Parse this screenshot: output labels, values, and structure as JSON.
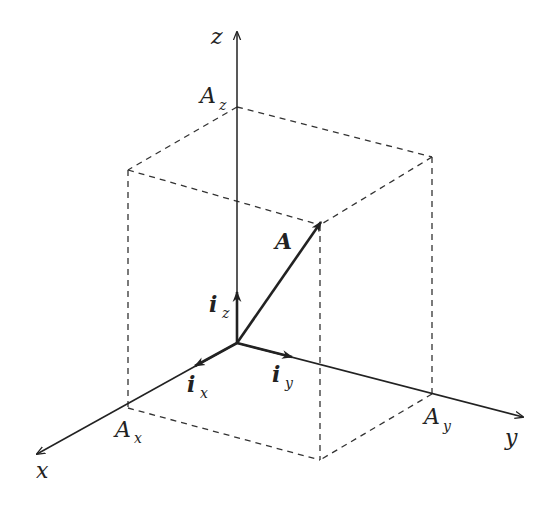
{
  "diagram": {
    "colors": {
      "line": "#222222",
      "dashed": "#333333",
      "background": "#ffffff"
    },
    "points": {
      "origin": [
        237,
        343
      ],
      "z_end": [
        237,
        30
      ],
      "x_end": [
        35,
        455
      ],
      "y_end": [
        525,
        417
      ],
      "Az": [
        237,
        107
      ],
      "Ax": [
        128,
        408
      ],
      "Ay": [
        432,
        394
      ],
      "A_tip": [
        320,
        222
      ],
      "top_left": [
        128,
        170
      ],
      "top_right": [
        432,
        157
      ],
      "top_front": [
        320,
        225
      ],
      "bottom_front": [
        320,
        460
      ]
    },
    "labels": {
      "z_axis": "z",
      "x_axis": "x",
      "y_axis": "y",
      "Az": "A",
      "Az_sub": "z",
      "Ax": "A",
      "Ax_sub": "x",
      "Ay": "A",
      "Ay_sub": "y",
      "vector": "A",
      "ix": "i",
      "ix_sub": "x",
      "iy": "i",
      "iy_sub": "y",
      "iz": "i",
      "iz_sub": "z"
    }
  }
}
